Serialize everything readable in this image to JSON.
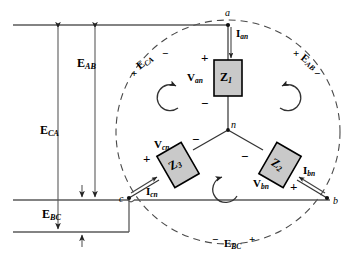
{
  "figure": {
    "background": "#ffffff",
    "line_color": "#3a3a3a",
    "impedance_fill": "#c9c9c9",
    "impedance_stroke": "#000000"
  },
  "nodes": [
    {
      "id": "a",
      "label": "a",
      "x": 228,
      "y": 20
    },
    {
      "id": "b",
      "label": "b",
      "x": 327,
      "y": 198
    },
    {
      "id": "c",
      "label": "c",
      "x": 129,
      "y": 198
    },
    {
      "id": "n",
      "label": "n",
      "x": 228,
      "y": 130
    }
  ],
  "impedances": [
    {
      "id": "Z1",
      "label": "Z",
      "subscript": "1",
      "x": 228,
      "y": 78,
      "rotation": 0
    },
    {
      "id": "Z2",
      "label": "Z",
      "subscript": "2",
      "x": 280,
      "y": 165,
      "rotation": 30
    },
    {
      "id": "Z3",
      "label": "Z",
      "subscript": "3",
      "x": 178,
      "y": 165,
      "rotation": -30
    }
  ],
  "phase_voltages": [
    {
      "id": "Van",
      "label": "V",
      "subscript": "an",
      "x": 196,
      "y": 79,
      "plus": {
        "x": 202,
        "y": 57
      },
      "minus": {
        "x": 202,
        "y": 102
      }
    },
    {
      "id": "Vbn",
      "label": "V",
      "subscript": "bn",
      "x": 262,
      "y": 184,
      "plus": {
        "x": 294,
        "y": 186
      },
      "minus": {
        "x": 245,
        "y": 156
      }
    },
    {
      "id": "Vcn",
      "label": "V",
      "subscript": "cn",
      "x": 164,
      "y": 145,
      "plus": {
        "x": 147,
        "y": 158
      },
      "minus": {
        "x": 196,
        "y": 139
      }
    }
  ],
  "line_currents": [
    {
      "id": "Ian",
      "label": "I",
      "subscript": "an",
      "x": 237,
      "y": 32
    },
    {
      "id": "Ibn",
      "label": "I",
      "subscript": "bn",
      "x": 307,
      "y": 170
    },
    {
      "id": "Icn",
      "label": "I",
      "subscript": "cn",
      "x": 152,
      "y": 190
    }
  ],
  "source_voltages_on_circle": [
    {
      "id": "ECA_circle",
      "label": "E",
      "subscript": "CA",
      "x": 145,
      "y": 58,
      "rotation": -35,
      "plus": {
        "x": 134,
        "y": 72
      },
      "minus": {
        "x": 166,
        "y": 54
      }
    },
    {
      "id": "EAB_circle",
      "label": "E",
      "subscript": "AB",
      "x": 305,
      "y": 59,
      "rotation": 35,
      "plus": {
        "x": 298,
        "y": 53
      },
      "minus": {
        "x": 315,
        "y": 72
      }
    },
    {
      "id": "EBC_circle",
      "label": "E",
      "subscript": "BC",
      "x": 231,
      "y": 243,
      "rotation": 0,
      "minus": {
        "x": 215,
        "y": 238
      },
      "plus": {
        "x": 256,
        "y": 238
      }
    }
  ],
  "source_voltage_arrows": [
    {
      "id": "EAB_arrow",
      "label": "E",
      "subscript": "AB",
      "label_x": 80,
      "label_y": 62,
      "x": 95,
      "y_top": 25,
      "y_bottom": 200
    },
    {
      "id": "ECA_arrow",
      "label": "E",
      "subscript": "CA",
      "label_x": 43,
      "label_y": 128,
      "x": 58,
      "y_top": 25,
      "y_bottom": 232
    },
    {
      "id": "EBC_arrow",
      "label": "E",
      "subscript": "BC",
      "label_x": 45,
      "label_y": 213,
      "x": 82,
      "y_top": 200,
      "y_bottom": 232
    }
  ],
  "bus_lines": [
    {
      "id": "line-a",
      "y": 25,
      "x1": 13,
      "x2": 228
    },
    {
      "id": "line-b",
      "y": 200,
      "x1": 13,
      "x2": 330
    },
    {
      "id": "line-c",
      "y": 232,
      "x1": 13,
      "x2": 129
    }
  ],
  "dashed_circle": {
    "cx": 228,
    "cy": 132,
    "r": 112
  },
  "loop_arrows": [
    {
      "id": "loop-top-left",
      "cx": 170,
      "cy": 97
    },
    {
      "id": "loop-top-right",
      "cx": 288,
      "cy": 97
    },
    {
      "id": "loop-bottom",
      "cx": 229,
      "cy": 186
    }
  ]
}
